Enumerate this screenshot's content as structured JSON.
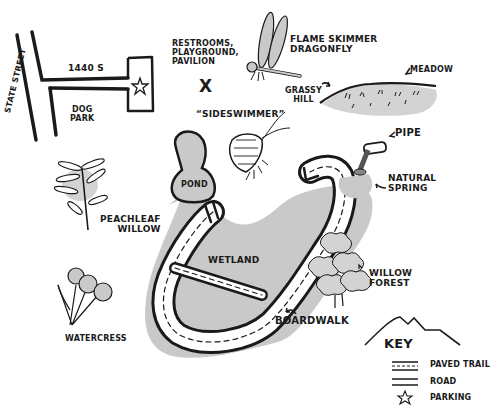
{
  "map": {
    "streets": {
      "state_street": "State Street",
      "cross_street": "1440 S"
    },
    "areas": {
      "dog_park": "Dog\nPark",
      "pond": "Pond",
      "wetland": "Wetland",
      "meadow": "Meadow",
      "grassy_hill": "Grassy\nHill",
      "natural_spring": "Natural\nSpring",
      "willow_forest": "Willow\nForest"
    },
    "landmarks": {
      "facilities": "Restrooms,\nPlayground,\nPavilion",
      "facilities_marker": "X",
      "pipe": "Pipe",
      "boardwalk": "Boardwalk"
    },
    "wildlife": {
      "dragonfly": "Flame Skimmer\nDragonfly",
      "sideswimmer": "“Sideswimmer”",
      "peachleaf_willow": "Peachleaf\nWillow",
      "watercress": "Watercress"
    }
  },
  "key": {
    "title": "Key",
    "items": [
      {
        "symbol": "paved-trail",
        "label": "Paved Trail"
      },
      {
        "symbol": "road",
        "label": "Road"
      },
      {
        "symbol": "star",
        "label": "Parking"
      }
    ]
  },
  "colors": {
    "ink": "#1a1a1a",
    "wetland_fill": "#c9c9c9",
    "shade": "#d3d3d3",
    "background": "#ffffff"
  }
}
